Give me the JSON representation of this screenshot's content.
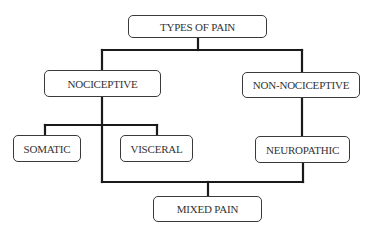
{
  "diagram": {
    "type": "hierarchy",
    "nodes": {
      "root": {
        "label": "TYPES OF PAIN"
      },
      "nociceptive": {
        "label": "NOCICEPTIVE"
      },
      "non_nociceptive": {
        "label": "NON-NOCICEPTIVE"
      },
      "somatic": {
        "label": "SOMATIC"
      },
      "visceral": {
        "label": "VISCERAL"
      },
      "neuropathic": {
        "label": "NEUROPATHIC"
      },
      "mixed": {
        "label": "MIXED PAIN"
      }
    },
    "edges": [
      [
        "TYPES OF PAIN",
        "NOCICEPTIVE"
      ],
      [
        "TYPES OF PAIN",
        "NON-NOCICEPTIVE"
      ],
      [
        "NOCICEPTIVE",
        "SOMATIC"
      ],
      [
        "NOCICEPTIVE",
        "VISCERAL"
      ],
      [
        "NON-NOCICEPTIVE",
        "NEUROPATHIC"
      ],
      [
        "NOCICEPTIVE",
        "MIXED PAIN"
      ],
      [
        "NEUROPATHIC",
        "MIXED PAIN"
      ]
    ],
    "line_color": "#1a1a1a",
    "box_border_color": "#3a3a3a"
  }
}
